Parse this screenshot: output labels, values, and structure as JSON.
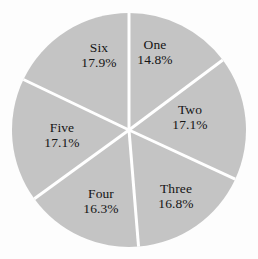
{
  "chart_data": {
    "type": "pie",
    "title": "",
    "subtitle": "",
    "xlabel": "",
    "ylabel": "",
    "legend_position": "none",
    "grid": false,
    "start_angle_deg": 90,
    "direction": "clockwise",
    "categories": [
      "One",
      "Two",
      "Three",
      "Four",
      "Five",
      "Six"
    ],
    "values": [
      14.8,
      17.1,
      16.8,
      16.3,
      17.1,
      17.9
    ],
    "value_suffix": "%",
    "slices": [
      {
        "label": "One",
        "percent_text": "14.8%",
        "value": 14.8,
        "color": "#c4c4c4",
        "label_x": 155,
        "label_y": 52
      },
      {
        "label": "Two",
        "percent_text": "17.1%",
        "value": 17.1,
        "color": "#c4c4c4",
        "label_x": 190,
        "label_y": 117
      },
      {
        "label": "Three",
        "percent_text": "16.8%",
        "value": 16.8,
        "color": "#c4c4c4",
        "label_x": 176,
        "label_y": 196
      },
      {
        "label": "Four",
        "percent_text": "16.3%",
        "value": 16.3,
        "color": "#c4c4c4",
        "label_x": 101,
        "label_y": 201
      },
      {
        "label": "Five",
        "percent_text": "17.1%",
        "value": 17.1,
        "color": "#c4c4c4",
        "label_x": 62,
        "label_y": 135
      },
      {
        "label": "Six",
        "percent_text": "17.9%",
        "value": 17.9,
        "color": "#c4c4c4",
        "label_x": 99,
        "label_y": 55
      }
    ]
  },
  "style": {
    "background": "#fdfdfd",
    "slice_fill": "#c4c4c4",
    "separator": "#ffffff",
    "text_color": "#151515"
  },
  "geometry": {
    "center_x": 129,
    "center_y": 130,
    "radius": 117,
    "separator_width": 3
  }
}
